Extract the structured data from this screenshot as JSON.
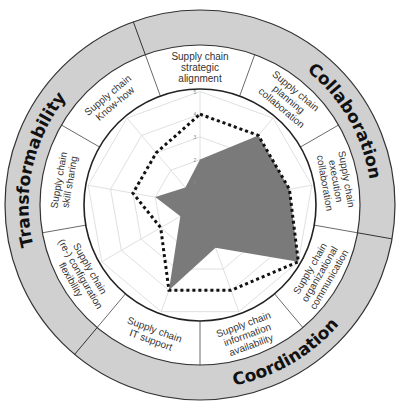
{
  "diagram": {
    "categories": [
      {
        "label": "Collaboration"
      },
      {
        "label": "Coordination"
      },
      {
        "label": "Transformability"
      }
    ],
    "dimensions": [
      {
        "lines": [
          "Supply chain",
          "strategic",
          "alignment"
        ]
      },
      {
        "lines": [
          "Supply chain",
          "planning",
          "collaboration"
        ]
      },
      {
        "lines": [
          "Supply chain",
          "execution",
          "collaboration"
        ]
      },
      {
        "lines": [
          "Supply chain",
          "organizational",
          "communication"
        ]
      },
      {
        "lines": [
          "Supply chain",
          "information",
          "availability"
        ]
      },
      {
        "lines": [
          "Supply chain",
          "IT support"
        ]
      },
      {
        "lines": [
          "Supply chain",
          "(re-) configuration",
          "flexibility"
        ]
      },
      {
        "lines": [
          "Supply chain",
          "skill sharing"
        ]
      },
      {
        "lines": [
          "Supply chain",
          "Know-how"
        ]
      }
    ],
    "scale_ticks": [
      "1",
      "2",
      "3",
      "4",
      "5"
    ],
    "colors": {
      "outer_ring": "#d0d0d0",
      "actual_fill": "#7a7a7a",
      "target_line": "#111111",
      "grid": "#d8d8d8"
    }
  },
  "chart_data": {
    "type": "radar",
    "title": "",
    "axes": [
      "Supply chain strategic alignment",
      "Supply chain planning collaboration",
      "Supply chain execution collaboration",
      "Supply chain organizational communication",
      "Supply chain information availability",
      "Supply chain IT support",
      "Supply chain (re-) configuration flexibility",
      "Supply chain skill sharing",
      "Supply chain Know-how"
    ],
    "range": [
      0,
      5
    ],
    "tick_labels": [
      "1",
      "2",
      "3",
      "4",
      "5"
    ],
    "grid": true,
    "series": [
      {
        "name": "Actual (filled)",
        "style": "filled-gray",
        "values": [
          2,
          4,
          4,
          5,
          2,
          4,
          1,
          2,
          1
        ]
      },
      {
        "name": "Target (dotted)",
        "style": "dotted-black",
        "values": [
          4,
          4,
          4,
          5,
          4,
          4,
          2,
          3,
          3
        ]
      }
    ],
    "groups": [
      {
        "name": "Collaboration",
        "axes": [
          "Supply chain strategic alignment",
          "Supply chain planning collaboration",
          "Supply chain execution collaboration"
        ]
      },
      {
        "name": "Coordination",
        "axes": [
          "Supply chain organizational communication",
          "Supply chain information availability",
          "Supply chain IT support"
        ]
      },
      {
        "name": "Transformability",
        "axes": [
          "Supply chain (re-) configuration flexibility",
          "Supply chain skill sharing",
          "Supply chain Know-how"
        ]
      }
    ]
  }
}
